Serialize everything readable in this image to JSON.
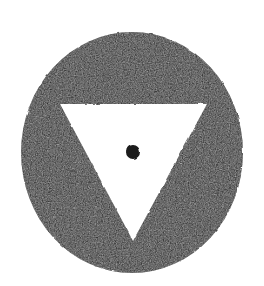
{
  "document": {
    "title": "Alchemical Symbol Mark",
    "canvas": {
      "width": 264,
      "height": 286,
      "background_color": "#ffffff"
    }
  },
  "figure": {
    "name": "circle-with-inverted-triangle-and-center-dot",
    "description": "Solid dark disc containing a white downward-pointing triangle with a small dark dot at its centre",
    "ink_color": "#1a1a1a",
    "paper_color": "#ffffff",
    "texture": "grainy printed halftone edges",
    "shapes": [
      {
        "name": "outer-disc",
        "type": "circle",
        "fill": "#1a1a1a",
        "center_x": 132,
        "center_y": 152.5,
        "radius_x": 111,
        "radius_y": 120.5
      },
      {
        "name": "inverted-triangle",
        "type": "polygon",
        "fill": "#ffffff",
        "points": "60,104 207,104 133,241"
      },
      {
        "name": "center-dot",
        "type": "circle",
        "fill": "#1a1a1a",
        "center_x": 133,
        "center_y": 152,
        "radius_x": 7,
        "radius_y": 7
      }
    ]
  }
}
